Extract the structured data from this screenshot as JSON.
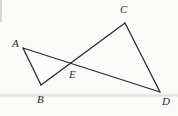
{
  "figure": {
    "background_color": "#fbfbf9",
    "ink_color": "#2b2b2b",
    "stroke_width": 1.3,
    "width": 178,
    "height": 116,
    "points": {
      "A": {
        "x": 23,
        "y": 48,
        "label": "A",
        "label_x": 12,
        "label_y": 38
      },
      "B": {
        "x": 41,
        "y": 85,
        "label": "B",
        "label_x": 37,
        "label_y": 94
      },
      "C": {
        "x": 125,
        "y": 23,
        "label": "C",
        "label_x": 120,
        "label_y": 4
      },
      "D": {
        "x": 160,
        "y": 92,
        "label": "D",
        "label_x": 162,
        "label_y": 96
      },
      "E": {
        "x": 71,
        "y": 64,
        "label": "E",
        "label_x": 69,
        "label_y": 69
      }
    },
    "segments": [
      {
        "name": "segment-AD",
        "from": "A",
        "to": "D"
      },
      {
        "name": "segment-BC",
        "from": "B",
        "to": "C"
      },
      {
        "name": "segment-AB",
        "from": "A",
        "to": "B"
      },
      {
        "name": "segment-CD",
        "from": "C",
        "to": "D"
      }
    ],
    "artifacts": {
      "fold_line_y": 95,
      "left_edge_mark": true
    }
  }
}
